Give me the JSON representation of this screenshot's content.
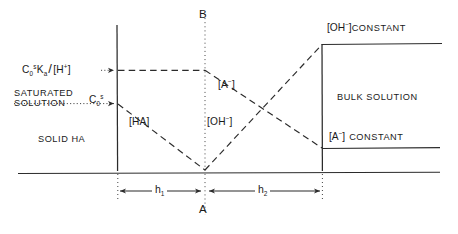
{
  "diagram": {
    "regions": {
      "solid": "SOLID HA",
      "saturated_line1": "SATURATED",
      "saturated_line2": "SOLUTION",
      "bulk": "BULK SOLUTION"
    },
    "axis_labels": {
      "top_point": "B",
      "bottom_point": "A",
      "h1": "h",
      "h1_sub": "1",
      "h2": "h",
      "h2_sub": "2"
    },
    "concentration_labels": {
      "ha_bracket": "[HA]",
      "a_minus": "[A",
      "a_minus_sup": "−",
      "a_minus_close": "]",
      "oh_minus": "[OH",
      "oh_minus_sup": "−",
      "oh_minus_close": "]"
    },
    "left_axis": {
      "upper_value_c": "C",
      "upper_value_sub": "0",
      "upper_value_sup": "s",
      "upper_value_ka": "K",
      "upper_value_ka_sub": "a",
      "upper_value_slash": "/",
      "upper_value_h": "[H",
      "upper_value_h_sup": "+",
      "upper_value_h_close": "]",
      "lower_value_c": "C",
      "lower_value_sub": "0",
      "lower_value_sup": "s"
    },
    "right_axis": {
      "oh_constant_bracket": "[OH",
      "oh_constant_sup": "−",
      "oh_constant_close": "]",
      "oh_constant_text": "CONSTANT",
      "a_constant_bracket": "[A",
      "a_constant_sup": "−",
      "a_constant_close": "]",
      "a_constant_text": "CONSTANT"
    },
    "colors": {
      "ink": "#1a1a1a",
      "line": "#2b2b2b",
      "background": "#ffffff"
    },
    "geometry": {
      "left_wall_x": 117,
      "right_wall_x": 322,
      "apex_x": 205,
      "baseline_y": 173,
      "apex_y": 170,
      "level_a_minus_y": 70,
      "level_saturated_y": 103,
      "level_oh_constant_y": 44,
      "level_a_constant_y": 148
    }
  }
}
